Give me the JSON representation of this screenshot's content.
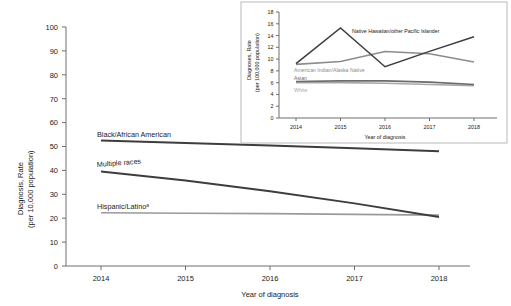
{
  "chart_data": [
    {
      "id": "main",
      "type": "line",
      "title": "",
      "xlabel": "Year of diagnosis",
      "ylabel": "Diagnosis, Rate (per 10,000 population)",
      "ylabel_line1": "Diagnosis, Rate",
      "ylabel_line2": "(per 10,000 population)",
      "x": [
        2014,
        2015,
        2016,
        2017,
        2018
      ],
      "xticks": [
        "2014",
        "2015",
        "2016",
        "2017",
        "2018"
      ],
      "yticks": [
        "0",
        "10",
        "20",
        "30",
        "40",
        "50",
        "60",
        "70",
        "80",
        "90",
        "100"
      ],
      "ylim": [
        0,
        100
      ],
      "xlim": [
        2014,
        2018
      ],
      "grid": false,
      "legend_position": "inline-labels",
      "series": [
        {
          "name": "Black/African American",
          "label": "Black/African American",
          "color": "#3d3d3d",
          "values": [
            52.5,
            51.5,
            50.4,
            49.3,
            48.0
          ]
        },
        {
          "name": "Multiple races",
          "label": "Multiple races",
          "color": "#3d3d3d",
          "values": [
            39.5,
            35.8,
            31.3,
            26.2,
            20.5
          ]
        },
        {
          "name": "Hispanic/Latino",
          "label": "Hispanic/Latinoᵃ",
          "color": "#9a9a9a",
          "values": [
            22.3,
            22.1,
            21.9,
            21.6,
            21.3
          ]
        }
      ]
    },
    {
      "id": "inset",
      "type": "line",
      "title": "",
      "xlabel": "Year of diagnosis",
      "ylabel": "Diagnoses, Rate (per 100,000 population)",
      "ylabel_line1": "Diagnoses, Rate",
      "ylabel_line2": "(per 100,000 population)",
      "x": [
        2014,
        2015,
        2016,
        2017,
        2018
      ],
      "xticks": [
        "2014",
        "2015",
        "2016",
        "2017",
        "2018"
      ],
      "yticks": [
        "0",
        "2",
        "4",
        "6",
        "8",
        "10",
        "12",
        "14",
        "16",
        "18"
      ],
      "ylim": [
        0,
        18
      ],
      "xlim": [
        2014,
        2018
      ],
      "grid": false,
      "legend_position": "inline-labels",
      "series": [
        {
          "name": "Native Hawaiian/other Pacific Islander",
          "label": "Native Hawaiian/other Pacific Islander",
          "color": "#3d3d3d",
          "values": [
            9.2,
            15.3,
            8.7,
            11.3,
            13.8
          ]
        },
        {
          "name": "American Indian/Alaska Native",
          "label": "American Indian/Alaska Native",
          "color": "#8c8c8c",
          "values": [
            9.1,
            9.6,
            11.3,
            10.9,
            9.5
          ]
        },
        {
          "name": "Asian",
          "label": "Asian",
          "color": "#6b6b6b",
          "values": [
            6.2,
            6.3,
            6.3,
            6.1,
            5.7
          ]
        },
        {
          "name": "White",
          "label": "White",
          "color": "#a8a8a8",
          "values": [
            6.0,
            6.0,
            5.9,
            5.7,
            5.5
          ]
        }
      ]
    }
  ],
  "figure": {
    "background": "#ffffff",
    "axis_color": "#6e6e6e",
    "inset_border_color": "#b9b9b9"
  }
}
